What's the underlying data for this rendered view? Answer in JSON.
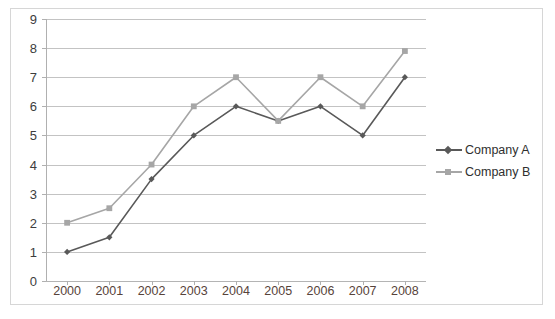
{
  "chart_data": {
    "type": "line",
    "title": "",
    "subtitle": "",
    "xlabel": "",
    "ylabel": "",
    "categories": [
      "2000",
      "2001",
      "2002",
      "2003",
      "2004",
      "2005",
      "2006",
      "2007",
      "2008"
    ],
    "ylim": [
      0,
      9
    ],
    "y_ticks": [
      "0",
      "1",
      "2",
      "3",
      "4",
      "5",
      "6",
      "7",
      "8",
      "9"
    ],
    "grid": true,
    "legend_position": "right",
    "series": [
      {
        "name": "Company A",
        "color": "#595959",
        "marker": "diamond",
        "values": [
          1,
          1.5,
          3.5,
          5,
          6,
          5.5,
          6,
          5,
          7
        ]
      },
      {
        "name": "Company B",
        "color": "#a6a6a6",
        "marker": "square",
        "values": [
          2,
          2.5,
          4,
          6,
          7,
          5.5,
          7,
          6,
          7.9
        ]
      }
    ]
  },
  "legend": {
    "items": [
      {
        "label": "Company A"
      },
      {
        "label": "Company B"
      }
    ]
  },
  "colors": {
    "series_a": "#595959",
    "series_b": "#a6a6a6",
    "gridline": "#c3c3c3",
    "axis": "#b0b0b0",
    "x_label": "#57433a",
    "y_label": "#3d3d3d",
    "frame_border": "#d6d6d6",
    "background": "#ffffff"
  }
}
